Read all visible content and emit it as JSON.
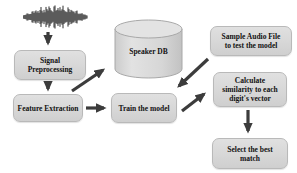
{
  "diagram": {
    "nodes": {
      "waveform": {
        "icon": "audio-waveform-icon"
      },
      "signal_preprocessing": {
        "label": "Signal\nPreprocessing"
      },
      "feature_extraction": {
        "label": "Feature Extraction"
      },
      "speaker_db": {
        "label": "Speaker DB",
        "shape": "cylinder"
      },
      "train_model": {
        "label": "Train the model"
      },
      "sample_audio": {
        "label": "Sample Audio File\nto test the model"
      },
      "calculate_similarity": {
        "label": "Calculate\nsimilarity to each\ndigit's vector"
      },
      "select_best": {
        "label": "Select the best\nmatch"
      }
    },
    "edges": [
      {
        "from": "waveform",
        "to": "signal_preprocessing"
      },
      {
        "from": "signal_preprocessing",
        "to": "feature_extraction"
      },
      {
        "from": "feature_extraction",
        "to": "speaker_db"
      },
      {
        "from": "feature_extraction",
        "to": "train_model"
      },
      {
        "from": "sample_audio",
        "to": "train_model"
      },
      {
        "from": "train_model",
        "to": "calculate_similarity"
      },
      {
        "from": "calculate_similarity",
        "to": "select_best"
      }
    ],
    "colors": {
      "background": "#ffffff",
      "box_fill": "#d8d8d8",
      "box_border": "#b9b9b9",
      "arrow": "#3c3c3c",
      "text": "#111111",
      "waveform": "#141414",
      "cylinder_stroke": "#a8a8a8"
    }
  }
}
